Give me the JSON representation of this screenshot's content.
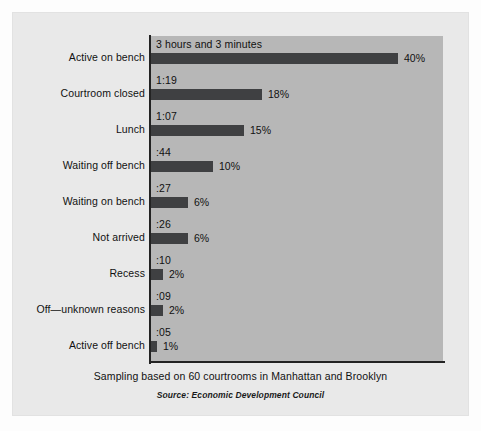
{
  "chart_data": {
    "type": "bar",
    "title": "",
    "orientation": "horizontal",
    "xlabel": "",
    "ylabel": "",
    "xlim": [
      0,
      40
    ],
    "grid": false,
    "legend": null,
    "categories": [
      "Active on bench",
      "Courtroom closed",
      "Lunch",
      "Waiting off bench",
      "Waiting on bench",
      "Not arrived",
      "Recess",
      "Off—unknown reasons",
      "Active off bench"
    ],
    "values": [
      40,
      18,
      15,
      10,
      6,
      6,
      2,
      2,
      1
    ],
    "value_labels": [
      "40%",
      "18%",
      "15%",
      "10%",
      "6%",
      "6%",
      "2%",
      "2%",
      "1%"
    ],
    "duration_labels": [
      "3 hours and 3 minutes",
      "1:19",
      "1:07",
      ":44",
      ":27",
      ":26",
      ":10",
      ":09",
      ":05"
    ],
    "note": "Sampling based on 60 courtrooms in Manhattan and Brooklyn",
    "source": "Source: Economic Development Council",
    "colors": {
      "bar": "#3f4042",
      "plot_background": "#b7b7b7",
      "card_background": "#e9e9e9",
      "axis": "#232323",
      "text": "#111111"
    }
  },
  "watermark": ""
}
